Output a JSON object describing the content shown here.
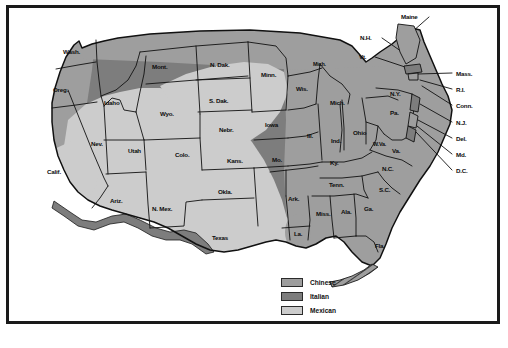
{
  "map": {
    "title": "United States regional map with ethnic-restaurant distribution shading",
    "colors": {
      "chinese": "#9e9e9e",
      "italian": "#7d7d7d",
      "mexican": "#cccccc",
      "border_band": "#7d7d7d",
      "outline": "#111111",
      "frame": "#1a1a1a",
      "background": "#ffffff"
    }
  },
  "legend": {
    "items": [
      {
        "label": "Chinese",
        "color": "#9e9e9e"
      },
      {
        "label": "Italian",
        "color": "#7d7d7d"
      },
      {
        "label": "Mexican",
        "color": "#cccccc"
      }
    ]
  },
  "states": {
    "inline": [
      {
        "id": "wash",
        "label": "Wash.",
        "x": 63,
        "y": 49,
        "size": "sm"
      },
      {
        "id": "oreg",
        "label": "Oreg.",
        "x": 53,
        "y": 87,
        "size": "sm"
      },
      {
        "id": "idaho",
        "label": "Idaho",
        "x": 104,
        "y": 100,
        "size": "sm"
      },
      {
        "id": "mont",
        "label": "Mont.",
        "x": 152,
        "y": 64,
        "size": "sm"
      },
      {
        "id": "ndak",
        "label": "N. Dak.",
        "x": 210,
        "y": 62,
        "size": "sm"
      },
      {
        "id": "sdak",
        "label": "S. Dak.",
        "x": 209,
        "y": 98,
        "size": "sm"
      },
      {
        "id": "wyo",
        "label": "Wyo.",
        "x": 160,
        "y": 111,
        "size": "sm"
      },
      {
        "id": "nebr",
        "label": "Nebr.",
        "x": 219,
        "y": 127,
        "size": "sm"
      },
      {
        "id": "nev",
        "label": "Nev.",
        "x": 91,
        "y": 141,
        "size": "sm"
      },
      {
        "id": "utah",
        "label": "Utah",
        "x": 128,
        "y": 148,
        "size": "sm"
      },
      {
        "id": "colo",
        "label": "Colo.",
        "x": 175,
        "y": 152,
        "size": "sm"
      },
      {
        "id": "kans",
        "label": "Kans.",
        "x": 227,
        "y": 158,
        "size": "sm"
      },
      {
        "id": "calif",
        "label": "Calif.",
        "x": 47,
        "y": 169,
        "size": "sm"
      },
      {
        "id": "ariz",
        "label": "Ariz.",
        "x": 110,
        "y": 198,
        "size": "sm"
      },
      {
        "id": "nmex",
        "label": "N. Mex.",
        "x": 152,
        "y": 206,
        "size": "sm"
      },
      {
        "id": "okla",
        "label": "Okla.",
        "x": 218,
        "y": 189,
        "size": "sm"
      },
      {
        "id": "texas",
        "label": "Texas",
        "x": 212,
        "y": 235,
        "size": "sm"
      },
      {
        "id": "minn",
        "label": "Minn.",
        "x": 261,
        "y": 72,
        "size": "sm"
      },
      {
        "id": "iowa",
        "label": "Iowa",
        "x": 265,
        "y": 122,
        "size": "sm"
      },
      {
        "id": "mo",
        "label": "Mo.",
        "x": 272,
        "y": 157,
        "size": "sm"
      },
      {
        "id": "ark",
        "label": "Ark.",
        "x": 288,
        "y": 196,
        "size": "sm"
      },
      {
        "id": "la",
        "label": "La.",
        "x": 294,
        "y": 231,
        "size": "sm"
      },
      {
        "id": "wis",
        "label": "Wis.",
        "x": 296,
        "y": 86,
        "size": "sm"
      },
      {
        "id": "michup",
        "label": "Mich.",
        "x": 313,
        "y": 62,
        "size": "xs"
      },
      {
        "id": "michlp",
        "label": "Mich.",
        "x": 330,
        "y": 100,
        "size": "sm"
      },
      {
        "id": "ill",
        "label": "Ill.",
        "x": 307,
        "y": 133,
        "size": "sm"
      },
      {
        "id": "ind",
        "label": "Ind.",
        "x": 331,
        "y": 138,
        "size": "sm"
      },
      {
        "id": "ohio",
        "label": "Ohio",
        "x": 353,
        "y": 130,
        "size": "sm"
      },
      {
        "id": "ky",
        "label": "Ky.",
        "x": 330,
        "y": 160,
        "size": "sm"
      },
      {
        "id": "tenn",
        "label": "Tenn.",
        "x": 329,
        "y": 182,
        "size": "sm"
      },
      {
        "id": "miss",
        "label": "Miss.",
        "x": 316,
        "y": 211,
        "size": "sm"
      },
      {
        "id": "ala",
        "label": "Ala.",
        "x": 341,
        "y": 209,
        "size": "sm"
      },
      {
        "id": "ga",
        "label": "Ga.",
        "x": 364,
        "y": 206,
        "size": "sm"
      },
      {
        "id": "fla",
        "label": "Fla.",
        "x": 375,
        "y": 243,
        "size": "sm"
      },
      {
        "id": "sc",
        "label": "S.C.",
        "x": 379,
        "y": 187,
        "size": "sm"
      },
      {
        "id": "nc",
        "label": "N.C.",
        "x": 382,
        "y": 166,
        "size": "sm"
      },
      {
        "id": "va",
        "label": "Va.",
        "x": 392,
        "y": 148,
        "size": "sm"
      },
      {
        "id": "wva",
        "label": "W.Va.",
        "x": 373,
        "y": 142,
        "size": "xs"
      },
      {
        "id": "pa",
        "label": "Pa.",
        "x": 390,
        "y": 110,
        "size": "sm"
      },
      {
        "id": "ny",
        "label": "N.Y.",
        "x": 390,
        "y": 91,
        "size": "sm"
      }
    ],
    "callouts": [
      {
        "id": "maine",
        "label": "Maine",
        "x": 401,
        "y": 14,
        "anchor": "right"
      },
      {
        "id": "nh",
        "label": "N.H.",
        "x": 360,
        "y": 35,
        "anchor": "right"
      },
      {
        "id": "vt",
        "label": "Vt.",
        "x": 359,
        "y": 54,
        "anchor": "right"
      },
      {
        "id": "mass",
        "label": "Mass.",
        "x": 456,
        "y": 71,
        "anchor": "left"
      },
      {
        "id": "ri",
        "label": "R.I.",
        "x": 456,
        "y": 87,
        "anchor": "left"
      },
      {
        "id": "conn",
        "label": "Conn.",
        "x": 456,
        "y": 103,
        "anchor": "left"
      },
      {
        "id": "nj",
        "label": "N.J.",
        "x": 456,
        "y": 120,
        "anchor": "left"
      },
      {
        "id": "del",
        "label": "Del.",
        "x": 456,
        "y": 136,
        "anchor": "left"
      },
      {
        "id": "md",
        "label": "Md.",
        "x": 456,
        "y": 152,
        "anchor": "left"
      },
      {
        "id": "dc",
        "label": "D.C.",
        "x": 456,
        "y": 168,
        "anchor": "left"
      }
    ]
  }
}
